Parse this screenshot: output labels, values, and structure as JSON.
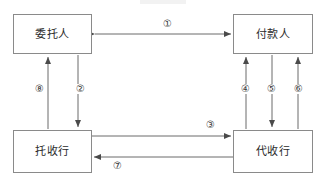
{
  "diagram": {
    "type": "flow-diagram",
    "canvas": {
      "width": 325,
      "height": 181
    },
    "colors": {
      "background": "#ffffff",
      "box_border": "#8a8a8a",
      "line": "#5a5a5a",
      "text": "#2b2b2b",
      "label_text": "#3a3a3a"
    },
    "nodes": [
      {
        "id": "principal",
        "label": "委托人",
        "x": 13,
        "y": 14,
        "width": 79,
        "height": 40
      },
      {
        "id": "payer",
        "label": "付款人",
        "x": 233,
        "y": 14,
        "width": 80,
        "height": 40
      },
      {
        "id": "remitting_bank",
        "label": "托收行",
        "x": 13,
        "y": 130,
        "width": 79,
        "height": 43
      },
      {
        "id": "collecting_bank",
        "label": "代收行",
        "x": 233,
        "y": 130,
        "width": 80,
        "height": 43
      }
    ],
    "edges": [
      {
        "id": "edge-1",
        "label": "①",
        "from": "principal",
        "to": "payer",
        "direction": "both",
        "orientation": "horizontal",
        "label_x": 162,
        "label_y": 19
      },
      {
        "id": "edge-2",
        "label": "②",
        "from": "principal",
        "to": "remitting_bank",
        "direction": "down",
        "orientation": "vertical",
        "label_x": 75,
        "label_y": 84
      },
      {
        "id": "edge-3",
        "label": "③",
        "from": "remitting_bank",
        "to": "collecting_bank",
        "direction": "right",
        "orientation": "horizontal",
        "label_x": 205,
        "label_y": 120
      },
      {
        "id": "edge-4",
        "label": "④",
        "from": "collecting_bank",
        "to": "payer",
        "direction": "up",
        "orientation": "vertical",
        "label_x": 240,
        "label_y": 84
      },
      {
        "id": "edge-5",
        "label": "⑤",
        "from": "payer",
        "to": "collecting_bank",
        "direction": "down",
        "orientation": "vertical",
        "label_x": 266,
        "label_y": 84
      },
      {
        "id": "edge-6",
        "label": "⑥",
        "from": "collecting_bank",
        "to": "payer",
        "direction": "up",
        "orientation": "vertical",
        "label_x": 293,
        "label_y": 84
      },
      {
        "id": "edge-7",
        "label": "⑦",
        "from": "collecting_bank",
        "to": "remitting_bank",
        "direction": "left",
        "orientation": "horizontal",
        "label_x": 112,
        "label_y": 161
      },
      {
        "id": "edge-8",
        "label": "⑧",
        "from": "remitting_bank",
        "to": "principal",
        "direction": "up",
        "orientation": "vertical",
        "label_x": 34,
        "label_y": 84
      }
    ]
  }
}
